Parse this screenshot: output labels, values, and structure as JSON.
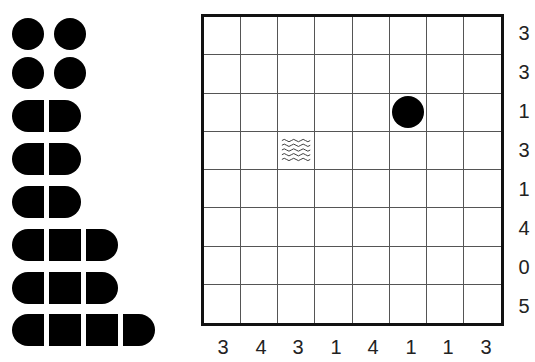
{
  "puzzle": {
    "type": "battleships",
    "grid_size": 8,
    "row_clues": [
      "3",
      "3",
      "1",
      "3",
      "1",
      "4",
      "0",
      "5"
    ],
    "col_clues": [
      "3",
      "4",
      "3",
      "1",
      "4",
      "1",
      "1",
      "3"
    ],
    "givens": [
      {
        "row": 2,
        "col": 5,
        "kind": "submarine"
      },
      {
        "row": 3,
        "col": 2,
        "kind": "water"
      }
    ]
  },
  "fleet": [
    {
      "name": "submarine",
      "length": 1,
      "count": 2,
      "row": 0
    },
    {
      "name": "submarine",
      "length": 1,
      "count": 2,
      "row": 1
    },
    {
      "name": "destroyer",
      "length": 2,
      "row": 2
    },
    {
      "name": "destroyer",
      "length": 2,
      "row": 3
    },
    {
      "name": "destroyer",
      "length": 2,
      "row": 4
    },
    {
      "name": "cruiser",
      "length": 3,
      "row": 5
    },
    {
      "name": "cruiser",
      "length": 3,
      "row": 6
    },
    {
      "name": "battleship",
      "length": 4,
      "row": 7
    }
  ],
  "colors": {
    "ship": "#000000",
    "grid_line": "#555555",
    "border": "#111111",
    "text": "#222222"
  }
}
